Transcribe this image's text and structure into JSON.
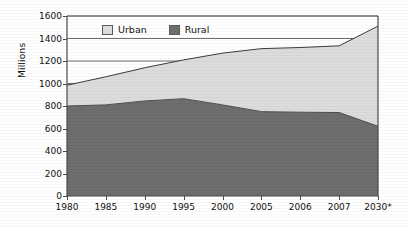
{
  "chart_data": {
    "type": "area",
    "stacked": true,
    "title": "",
    "xlabel": "",
    "ylabel": "Millions",
    "ylim": [
      0,
      1600
    ],
    "ytick_step": 200,
    "yticks": [
      "0",
      "200",
      "400",
      "600",
      "800",
      "1000",
      "1200",
      "1400",
      "1600"
    ],
    "categories": [
      "1980",
      "1985",
      "1990",
      "1995",
      "2000",
      "2005",
      "2006",
      "2007",
      "2030*"
    ],
    "grid": "horizontal-partial",
    "legend_position": "top-left-inside",
    "series": [
      {
        "name": "Rural",
        "color": "#6e6e6e",
        "values": [
          800,
          810,
          845,
          865,
          810,
          750,
          745,
          742,
          620
        ]
      },
      {
        "name": "Urban",
        "color": "#dcdcdc",
        "values": [
          185,
          250,
          295,
          345,
          460,
          560,
          575,
          593,
          890
        ]
      }
    ],
    "totals": [
      985,
      1060,
      1140,
      1210,
      1270,
      1310,
      1320,
      1335,
      1510
    ],
    "footnote": "*"
  },
  "legend": {
    "items": [
      {
        "label": "Urban",
        "swatch_name": "legend-swatch-urban",
        "color": "#dcdcdc"
      },
      {
        "label": "Rural",
        "swatch_name": "legend-swatch-rural",
        "color": "#6e6e6e"
      }
    ]
  },
  "colors": {
    "urban_fill": "#dcdcdc",
    "rural_fill": "#6e6e6e",
    "axis": "#4a4a4a",
    "gridline": "#5d5d5d",
    "series_outline": "#3a3a3a",
    "background": "#ffffff",
    "text": "#111111"
  }
}
